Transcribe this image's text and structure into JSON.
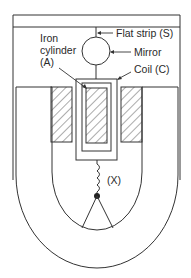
{
  "diagram": {
    "type": "moving-coil galvanometer",
    "labels": {
      "flat_strip": "Flat strip (S)",
      "mirror": "Mirror",
      "iron_cylinder_line1": "Iron",
      "iron_cylinder_line2": "cylinder",
      "iron_cylinder_line3": "(A)",
      "coil": "Coil (C)",
      "spring": "(X)"
    },
    "colors": {
      "stroke": "#333333",
      "background": "#ffffff"
    }
  }
}
